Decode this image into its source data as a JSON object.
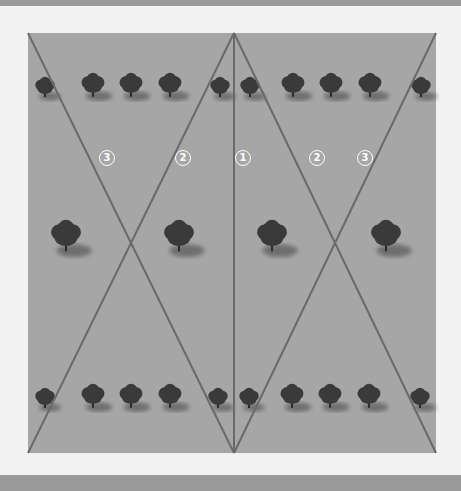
{
  "diagram": {
    "colors": {
      "background": "#f2f2f2",
      "band": "#9a9a9a",
      "field": "#a6a6a6",
      "line": "#6a6a6a",
      "tree": "#3a3a3a"
    },
    "labels": [
      {
        "text": "3",
        "x": 107,
        "y": 158
      },
      {
        "text": "2",
        "x": 183,
        "y": 158
      },
      {
        "text": "1",
        "x": 243,
        "y": 158
      },
      {
        "text": "2",
        "x": 317,
        "y": 158
      },
      {
        "text": "3",
        "x": 365,
        "y": 158
      }
    ],
    "lines": [
      {
        "x1": 28,
        "y1": 33,
        "x2": 234,
        "y2": 453
      },
      {
        "x1": 234,
        "y1": 33,
        "x2": 28,
        "y2": 453
      },
      {
        "x1": 234,
        "y1": 33,
        "x2": 436,
        "y2": 453
      },
      {
        "x1": 436,
        "y1": 33,
        "x2": 234,
        "y2": 453
      },
      {
        "x1": 234,
        "y1": 33,
        "x2": 234,
        "y2": 453
      }
    ],
    "trees": [
      {
        "x": 45,
        "y": 88,
        "r": 10
      },
      {
        "x": 93,
        "y": 86,
        "r": 12
      },
      {
        "x": 131,
        "y": 86,
        "r": 12
      },
      {
        "x": 170,
        "y": 86,
        "r": 12
      },
      {
        "x": 220,
        "y": 88,
        "r": 10
      },
      {
        "x": 250,
        "y": 88,
        "r": 10
      },
      {
        "x": 293,
        "y": 86,
        "r": 12
      },
      {
        "x": 331,
        "y": 86,
        "r": 12
      },
      {
        "x": 370,
        "y": 86,
        "r": 12
      },
      {
        "x": 421,
        "y": 88,
        "r": 10
      },
      {
        "x": 66,
        "y": 237,
        "r": 16
      },
      {
        "x": 179,
        "y": 237,
        "r": 16
      },
      {
        "x": 272,
        "y": 237,
        "r": 16
      },
      {
        "x": 386,
        "y": 237,
        "r": 16
      },
      {
        "x": 45,
        "y": 399,
        "r": 10
      },
      {
        "x": 93,
        "y": 397,
        "r": 12
      },
      {
        "x": 131,
        "y": 397,
        "r": 12
      },
      {
        "x": 170,
        "y": 397,
        "r": 12
      },
      {
        "x": 218,
        "y": 399,
        "r": 10
      },
      {
        "x": 249,
        "y": 399,
        "r": 10
      },
      {
        "x": 292,
        "y": 397,
        "r": 12
      },
      {
        "x": 330,
        "y": 397,
        "r": 12
      },
      {
        "x": 369,
        "y": 397,
        "r": 12
      },
      {
        "x": 420,
        "y": 399,
        "r": 10
      }
    ]
  }
}
